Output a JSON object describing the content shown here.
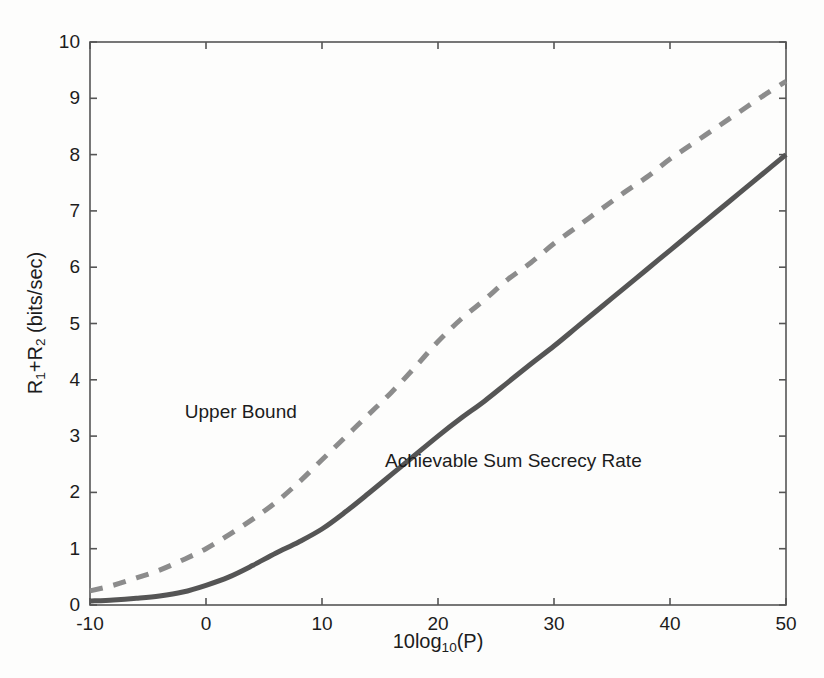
{
  "chart_data": {
    "type": "line",
    "title": "",
    "subtitle": "",
    "xlabel": "10log10(P)",
    "xlabel_parts": {
      "pre": "10log",
      "sub": "10",
      "post": "(P)"
    },
    "ylabel": "R1+R2 (bits/sec)",
    "ylabel_parts": {
      "r1": "R",
      "r1sub": "1",
      "plus": "+R",
      "r2sub": "2",
      "units": " (bits/sec)"
    },
    "xlim": [
      -10,
      50
    ],
    "ylim": [
      0,
      10
    ],
    "xticks": [
      -10,
      0,
      10,
      20,
      30,
      40,
      50
    ],
    "xtick_labels": [
      "-10",
      "0",
      "10",
      "20",
      "30",
      "40",
      "50"
    ],
    "yticks": [
      0,
      1,
      2,
      3,
      4,
      5,
      6,
      7,
      8,
      9,
      10
    ],
    "ytick_labels": [
      "0",
      "1",
      "2",
      "3",
      "4",
      "5",
      "6",
      "7",
      "8",
      "9",
      "10"
    ],
    "grid": false,
    "legend": "none",
    "legend_position": "inline-annotations",
    "x": [
      -10,
      -8,
      -6,
      -4,
      -2,
      0,
      2,
      4,
      6,
      8,
      10,
      12,
      14,
      16,
      18,
      20,
      22,
      24,
      26,
      28,
      30,
      32,
      34,
      36,
      38,
      40,
      42,
      44,
      46,
      48,
      50
    ],
    "series": [
      {
        "name": "Upper Bound",
        "style": "dashed",
        "color": "#8c8c8c",
        "width": 5,
        "values": [
          0.25,
          0.35,
          0.48,
          0.62,
          0.8,
          1.0,
          1.25,
          1.52,
          1.82,
          2.18,
          2.58,
          2.98,
          3.38,
          3.78,
          4.22,
          4.68,
          5.08,
          5.42,
          5.78,
          6.08,
          6.42,
          6.72,
          7.02,
          7.32,
          7.6,
          7.92,
          8.2,
          8.48,
          8.76,
          9.04,
          9.3
        ]
      },
      {
        "name": "Achievable Sum Secrecy Rate",
        "style": "solid",
        "color": "#555555",
        "width": 5,
        "values": [
          0.07,
          0.09,
          0.12,
          0.16,
          0.23,
          0.35,
          0.5,
          0.7,
          0.92,
          1.12,
          1.35,
          1.65,
          1.98,
          2.32,
          2.66,
          3.0,
          3.32,
          3.62,
          3.95,
          4.28,
          4.6,
          4.94,
          5.28,
          5.62,
          5.96,
          6.3,
          6.64,
          6.98,
          7.32,
          7.66,
          8.0
        ]
      }
    ],
    "annotations": [
      {
        "text": "Upper Bound",
        "x": 3.0,
        "y": 3.42
      },
      {
        "text": "Achievable Sum Secrecy Rate",
        "x": 26.5,
        "y": 2.55
      }
    ],
    "axis_color": "#555555",
    "text_color": "#1c1c1c",
    "background": "#fdfdfc"
  }
}
